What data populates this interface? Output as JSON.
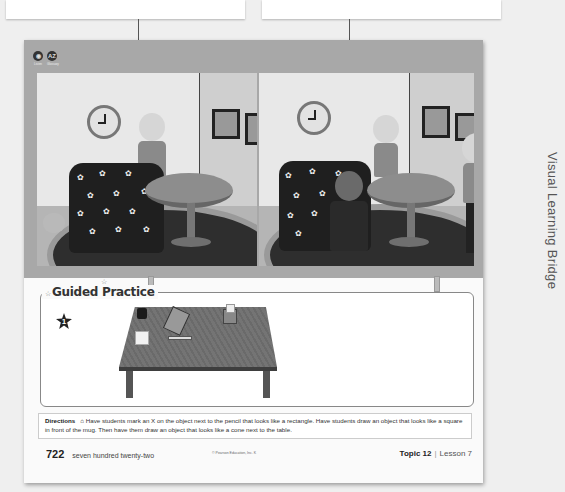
{
  "callouts": {
    "left": "",
    "right": ""
  },
  "toolbar": {
    "icons": [
      {
        "name": "glossary-icon",
        "glyph": "◉",
        "label": "Listen"
      },
      {
        "name": "az-glossary-icon",
        "glyph": "AZ",
        "label": "Glossary"
      }
    ]
  },
  "side_label": "Visual Learning Bridge",
  "guided_practice": {
    "title": "Guided Practice",
    "problem_number": "1"
  },
  "directions": {
    "label": "Directions",
    "text": "Have students mark an X on the object next to the pencil that looks like a rectangle. Have students draw an object that looks like a square in front of the mug. Then have them draw an object that looks like a cone next to the table."
  },
  "footer": {
    "page_number": "722",
    "page_words": "seven hundred twenty-two",
    "copyright": "© Pearson Education, Inc. K",
    "topic": "Topic 12",
    "lesson": "Lesson 7"
  },
  "colors": {
    "bar": "#a8a8a8",
    "page": "#fafafa",
    "background": "#efefef"
  }
}
